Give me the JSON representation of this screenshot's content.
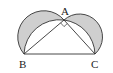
{
  "diagram": {
    "type": "geometry",
    "points": {
      "A": {
        "label": "A",
        "x": 64,
        "y": 20
      },
      "B": {
        "label": "B",
        "x": 24,
        "y": 54
      },
      "C": {
        "label": "C",
        "x": 95,
        "y": 54
      }
    },
    "right_angle_at": "A",
    "colors": {
      "stroke": "#333333",
      "shade": "#cfcfcf",
      "background": "#ffffff"
    }
  }
}
